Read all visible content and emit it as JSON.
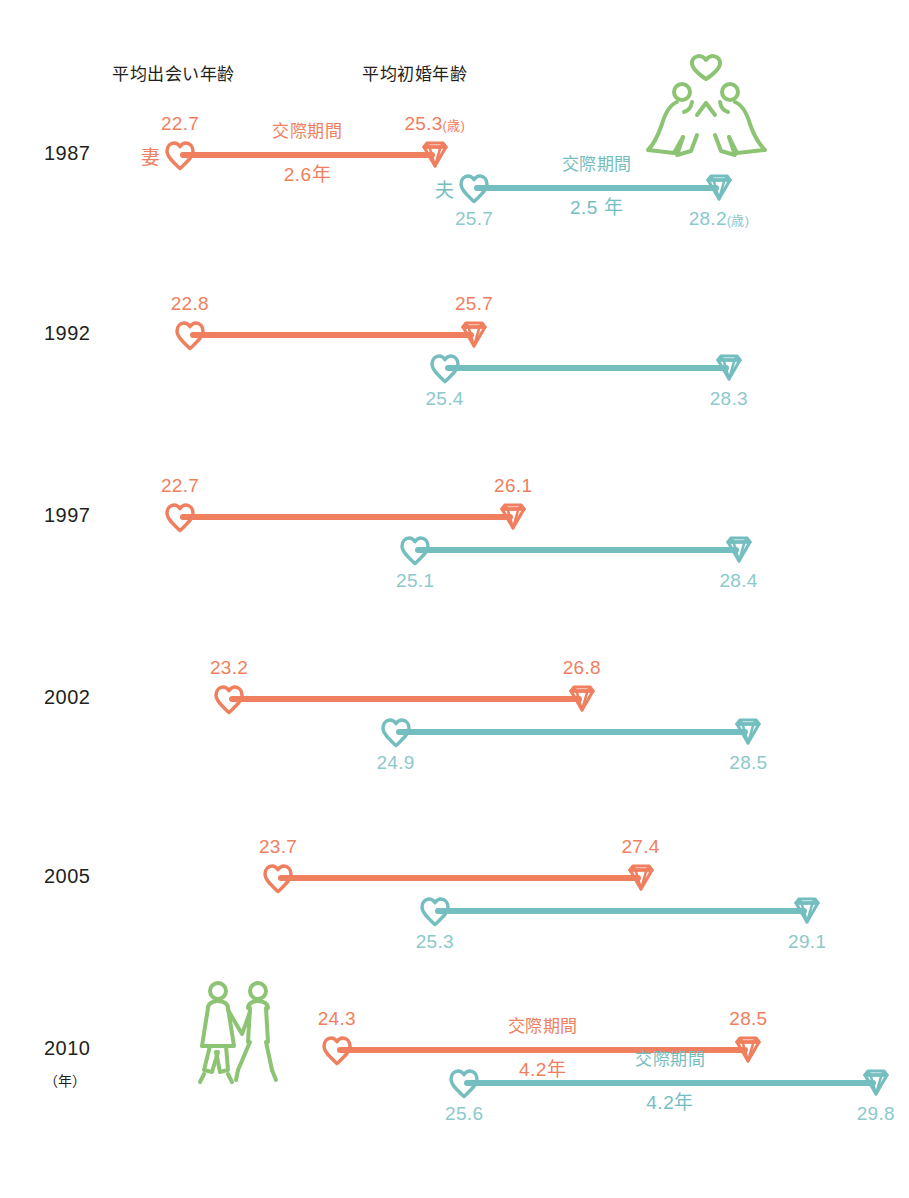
{
  "header": {
    "meet_label": "平均出会い年齢",
    "marry_label": "平均初婚年齢"
  },
  "axis": {
    "year_unit": "（年）",
    "age_unit": "(歳)"
  },
  "roles": {
    "wife": "妻",
    "husband": "夫"
  },
  "annotation": {
    "courtship_label": "交際期間"
  },
  "colors": {
    "wife": "#ef7f5e",
    "husband": "#75bec0",
    "wife_text": "#ef7f5e",
    "husband_text": "#8cc9cb",
    "icon_green": "#8cc474",
    "year_text": "#231f20"
  },
  "icons": {
    "wedding_couple": "wedding-couple-icon",
    "walking_couple": "walking-couple-icon",
    "heart": "heart-marker-icon",
    "diamond": "diamond-marker-icon"
  },
  "chart_data": {
    "type": "line",
    "xlabel": "年齢（歳）",
    "ylabel": "（年）",
    "xlim": [
      21.5,
      30.5
    ],
    "grid": false,
    "legend": [
      "妻",
      "夫"
    ],
    "categories": [
      "1987",
      "1992",
      "1997",
      "2002",
      "2005",
      "2010"
    ],
    "series": [
      {
        "name": "妻",
        "meet_age": [
          22.7,
          22.8,
          22.7,
          23.2,
          23.7,
          24.3
        ],
        "marry_age": [
          25.3,
          25.7,
          26.1,
          26.8,
          27.4,
          28.5
        ],
        "courtship_years": [
          2.6,
          null,
          null,
          null,
          null,
          4.2
        ]
      },
      {
        "name": "夫",
        "meet_age": [
          25.7,
          25.4,
          25.1,
          24.9,
          25.3,
          25.6
        ],
        "marry_age": [
          28.2,
          28.3,
          28.4,
          28.5,
          29.1,
          29.8
        ],
        "courtship_years": [
          2.5,
          null,
          null,
          null,
          null,
          4.2
        ]
      }
    ]
  },
  "rows": [
    {
      "year": "1987",
      "wife": {
        "meet": "22.7",
        "marry": "25.3",
        "marry_unit": "(歳)",
        "duration": "2.6年",
        "show_role": true,
        "show_annot": true
      },
      "husband": {
        "meet": "25.7",
        "marry": "28.2",
        "marry_unit": "(歳)",
        "duration": "2.5 年",
        "show_role": true,
        "show_annot": true
      }
    },
    {
      "year": "1992",
      "wife": {
        "meet": "22.8",
        "marry": "25.7",
        "marry_unit": "",
        "duration": "",
        "show_role": false,
        "show_annot": false
      },
      "husband": {
        "meet": "25.4",
        "marry": "28.3",
        "marry_unit": "",
        "duration": "",
        "show_role": false,
        "show_annot": false
      }
    },
    {
      "year": "1997",
      "wife": {
        "meet": "22.7",
        "marry": "26.1",
        "marry_unit": "",
        "duration": "",
        "show_role": false,
        "show_annot": false
      },
      "husband": {
        "meet": "25.1",
        "marry": "28.4",
        "marry_unit": "",
        "duration": "",
        "show_role": false,
        "show_annot": false
      }
    },
    {
      "year": "2002",
      "wife": {
        "meet": "23.2",
        "marry": "26.8",
        "marry_unit": "",
        "duration": "",
        "show_role": false,
        "show_annot": false
      },
      "husband": {
        "meet": "24.9",
        "marry": "28.5",
        "marry_unit": "",
        "duration": "",
        "show_role": false,
        "show_annot": false
      }
    },
    {
      "year": "2005",
      "wife": {
        "meet": "23.7",
        "marry": "27.4",
        "marry_unit": "",
        "duration": "",
        "show_role": false,
        "show_annot": false
      },
      "husband": {
        "meet": "25.3",
        "marry": "29.1",
        "marry_unit": "",
        "duration": "",
        "show_role": false,
        "show_annot": false
      }
    },
    {
      "year": "2010",
      "wife": {
        "meet": "24.3",
        "marry": "28.5",
        "marry_unit": "",
        "duration": "4.2年",
        "show_role": false,
        "show_annot": true
      },
      "husband": {
        "meet": "25.6",
        "marry": "29.8",
        "marry_unit": "",
        "duration": "4.2年",
        "show_role": false,
        "show_annot": true
      }
    }
  ]
}
